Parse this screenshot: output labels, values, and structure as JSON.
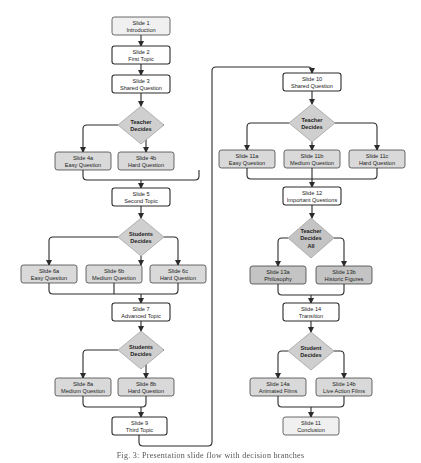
{
  "colors": {
    "line": "#2b2b2b",
    "box_white": "#ffffff",
    "box_light": "#f0f0f0",
    "box_gray": "#d9d9d9",
    "box_dark": "#c4c4c4",
    "diamond": "#cfcfcf",
    "text": "#222222"
  },
  "nodes": [
    {
      "id": "s1",
      "type": "box",
      "fill": "box_light",
      "x": 112,
      "y": 17,
      "w": 58,
      "h": 18,
      "lines": [
        "Slide 1",
        "Introduction"
      ]
    },
    {
      "id": "s2",
      "type": "box",
      "fill": "box_white",
      "x": 112,
      "y": 46,
      "w": 58,
      "h": 18,
      "lines": [
        "Slide 2",
        "First Topic"
      ]
    },
    {
      "id": "s3",
      "type": "box",
      "fill": "box_white",
      "x": 112,
      "y": 75,
      "w": 58,
      "h": 18,
      "lines": [
        "Slide 3",
        "Shared Question"
      ]
    },
    {
      "id": "d1",
      "type": "diamond",
      "cx": 141,
      "cy": 125,
      "w": 46,
      "h": 38,
      "lines": [
        "Teacher",
        "Decides"
      ]
    },
    {
      "id": "s4a",
      "type": "box",
      "fill": "box_gray",
      "x": 55,
      "y": 152,
      "w": 56,
      "h": 18,
      "lines": [
        "Slide 4a",
        "Easy Question"
      ]
    },
    {
      "id": "s4b",
      "type": "box",
      "fill": "box_gray",
      "x": 118,
      "y": 152,
      "w": 56,
      "h": 18,
      "lines": [
        "Slide 4b",
        "Hard Question"
      ]
    },
    {
      "id": "s5",
      "type": "box",
      "fill": "box_white",
      "x": 112,
      "y": 188,
      "w": 58,
      "h": 18,
      "lines": [
        "Slide 5",
        "Second Topic"
      ]
    },
    {
      "id": "d2",
      "type": "diamond",
      "cx": 141,
      "cy": 237,
      "w": 46,
      "h": 38,
      "lines": [
        "Students",
        "Decides"
      ]
    },
    {
      "id": "s6a",
      "type": "box",
      "fill": "box_gray",
      "x": 21,
      "y": 265,
      "w": 56,
      "h": 18,
      "lines": [
        "Slide 6a",
        "Easy Question"
      ]
    },
    {
      "id": "s6b",
      "type": "box",
      "fill": "box_gray",
      "x": 86,
      "y": 265,
      "w": 56,
      "h": 18,
      "lines": [
        "Slide 6b",
        "Medium Question"
      ]
    },
    {
      "id": "s6c",
      "type": "box",
      "fill": "box_gray",
      "x": 150,
      "y": 265,
      "w": 56,
      "h": 18,
      "lines": [
        "Slide 6c",
        "Hard Question"
      ]
    },
    {
      "id": "s7",
      "type": "box",
      "fill": "box_white",
      "x": 112,
      "y": 303,
      "w": 58,
      "h": 18,
      "lines": [
        "Slide 7",
        "Advanced Topic"
      ]
    },
    {
      "id": "d3",
      "type": "diamond",
      "cx": 141,
      "cy": 350,
      "w": 46,
      "h": 38,
      "lines": [
        "Students",
        "Decides"
      ]
    },
    {
      "id": "s8a",
      "type": "box",
      "fill": "box_gray",
      "x": 55,
      "y": 378,
      "w": 56,
      "h": 18,
      "lines": [
        "Slide 8a",
        "Medium Question"
      ]
    },
    {
      "id": "s8b",
      "type": "box",
      "fill": "box_gray",
      "x": 118,
      "y": 378,
      "w": 56,
      "h": 18,
      "lines": [
        "Slide 8b",
        "Hard Question"
      ]
    },
    {
      "id": "s9",
      "type": "box",
      "fill": "box_white",
      "x": 112,
      "y": 417,
      "w": 55,
      "h": 18,
      "lines": [
        "Slide 9",
        "Third Topic"
      ]
    },
    {
      "id": "s10",
      "type": "box",
      "fill": "box_white",
      "x": 283,
      "y": 73,
      "w": 58,
      "h": 18,
      "lines": [
        "Slide 10",
        "Shared Question"
      ]
    },
    {
      "id": "d4",
      "type": "diamond",
      "cx": 312,
      "cy": 123,
      "w": 46,
      "h": 38,
      "lines": [
        "Teacher",
        "Decides"
      ]
    },
    {
      "id": "s11a",
      "type": "box",
      "fill": "box_gray",
      "x": 219,
      "y": 150,
      "w": 56,
      "h": 18,
      "lines": [
        "Slide 11a",
        "Easy Question"
      ]
    },
    {
      "id": "s11b",
      "type": "box",
      "fill": "box_gray",
      "x": 284,
      "y": 150,
      "w": 56,
      "h": 18,
      "lines": [
        "Slide 11b",
        "Medium Question"
      ]
    },
    {
      "id": "s11c",
      "type": "box",
      "fill": "box_gray",
      "x": 349,
      "y": 150,
      "w": 56,
      "h": 18,
      "lines": [
        "Slide 11c",
        "Hard Question"
      ]
    },
    {
      "id": "s12",
      "type": "box",
      "fill": "box_white",
      "x": 283,
      "y": 187,
      "w": 58,
      "h": 18,
      "lines": [
        "Slide 12",
        "Important Questions"
      ]
    },
    {
      "id": "d5",
      "type": "diamond",
      "cx": 311,
      "cy": 238,
      "w": 46,
      "h": 40,
      "dark": true,
      "lines": [
        "Teacher",
        "Decides",
        "All"
      ]
    },
    {
      "id": "s13a",
      "type": "box",
      "fill": "box_dark",
      "x": 250,
      "y": 266,
      "w": 56,
      "h": 18,
      "lines": [
        "Slide 13a",
        "Philosophy"
      ]
    },
    {
      "id": "s13b",
      "type": "box",
      "fill": "box_dark",
      "x": 316,
      "y": 266,
      "w": 56,
      "h": 18,
      "lines": [
        "Slide 13b",
        "Historic Figures"
      ]
    },
    {
      "id": "s14",
      "type": "box",
      "fill": "box_white",
      "x": 283,
      "y": 303,
      "w": 56,
      "h": 18,
      "lines": [
        "Slide 14",
        "Transition"
      ]
    },
    {
      "id": "d6",
      "type": "diamond",
      "cx": 311,
      "cy": 351,
      "w": 46,
      "h": 38,
      "lines": [
        "Student",
        "Decides"
      ]
    },
    {
      "id": "s14a",
      "type": "box",
      "fill": "box_gray",
      "x": 250,
      "y": 378,
      "w": 56,
      "h": 18,
      "lines": [
        "Slide 14a",
        "Animated Films"
      ]
    },
    {
      "id": "s14b",
      "type": "box",
      "fill": "box_gray",
      "x": 316,
      "y": 378,
      "w": 56,
      "h": 18,
      "lines": [
        "Slide 14b",
        "Live Action Films"
      ]
    },
    {
      "id": "s11",
      "type": "box",
      "fill": "box_light",
      "x": 283,
      "y": 417,
      "w": 56,
      "h": 18,
      "lines": [
        "Slide 11",
        "Conclusion"
      ]
    }
  ],
  "edges": [
    {
      "d": "M141 35 V46",
      "arrow": true
    },
    {
      "d": "M141 64 V75",
      "arrow": true
    },
    {
      "d": "M141 93 V106",
      "arrow": true
    },
    {
      "d": "M118 125 H87 Q83 125 83 129 V152",
      "arrow": true
    },
    {
      "d": "M164 125 H142 Q146 125 146 129 V152",
      "arrow": true,
      "alt": "M164 125 H142"
    },
    {
      "d": "M83 170 V176 Q83 180 87 180 H195 Q199 180 199 176 V170",
      "arrow": false
    },
    {
      "d": "M141 180 V188",
      "arrow": true
    },
    {
      "d": "M141 206 V218",
      "arrow": true
    },
    {
      "d": "M118 237 H53 Q49 237 49 241 V265",
      "arrow": true
    },
    {
      "d": "M164 237 H174 Q178 237 178 241 V265",
      "arrow": true
    },
    {
      "d": "M141 256 V265",
      "arrow": true
    },
    {
      "d": "M49 283 V290 Q49 294 53 294 H174 Q178 294 178 290 V283",
      "arrow": false
    },
    {
      "d": "M114 283 V294",
      "arrow": false
    },
    {
      "d": "M141 294 V303",
      "arrow": true
    },
    {
      "d": "M141 321 V331",
      "arrow": true
    },
    {
      "d": "M118 350 H87 Q83 350 83 354 V378",
      "arrow": true
    },
    {
      "d": "M164 350 H142 Q146 350 146 354 V378",
      "arrow": true
    },
    {
      "d": "M83 396 V403 Q83 407 87 407 H142 Q146 407 146 403 V396",
      "arrow": false
    },
    {
      "d": "M141 407 V417",
      "arrow": true
    },
    {
      "d": "M139 435 V442 Q139 446 143 446 H208 Q212 446 212 442 V71 Q212 67 216 67 H308 Q312 67 312 71 V73",
      "arrow": true
    },
    {
      "d": "M312 91 V104",
      "arrow": true
    },
    {
      "d": "M289 123 H251 Q247 123 247 127 V150",
      "arrow": true
    },
    {
      "d": "M335 123 H373 Q377 123 377 127 V150",
      "arrow": true
    },
    {
      "d": "M312 142 V150",
      "arrow": true
    },
    {
      "d": "M247 168 V175 Q247 179 251 179 H373 Q377 179 377 175 V168",
      "arrow": false
    },
    {
      "d": "M312 168 V187",
      "arrow": true
    },
    {
      "d": "M312 205 V218",
      "arrow": true
    },
    {
      "d": "M288 238 H282 Q278 238 278 242 V266",
      "arrow": true
    },
    {
      "d": "M334 238 H340 Q344 238 344 242 V266",
      "arrow": true
    },
    {
      "d": "M278 284 V291 Q278 295 282 295 H340 Q344 295 344 291 V284",
      "arrow": false
    },
    {
      "d": "M311 295 V303",
      "arrow": true
    },
    {
      "d": "M311 321 V332",
      "arrow": true
    },
    {
      "d": "M288 351 H282 Q278 351 278 355 V378",
      "arrow": true
    },
    {
      "d": "M334 351 H340 Q344 351 344 355 V378",
      "arrow": true
    },
    {
      "d": "M278 396 V403 Q278 407 282 407 H340 Q344 407 344 403 V396",
      "arrow": false
    },
    {
      "d": "M311 407 V417",
      "arrow": true
    }
  ],
  "caption": "Fig. 3: Presentation slide flow with decision branches"
}
